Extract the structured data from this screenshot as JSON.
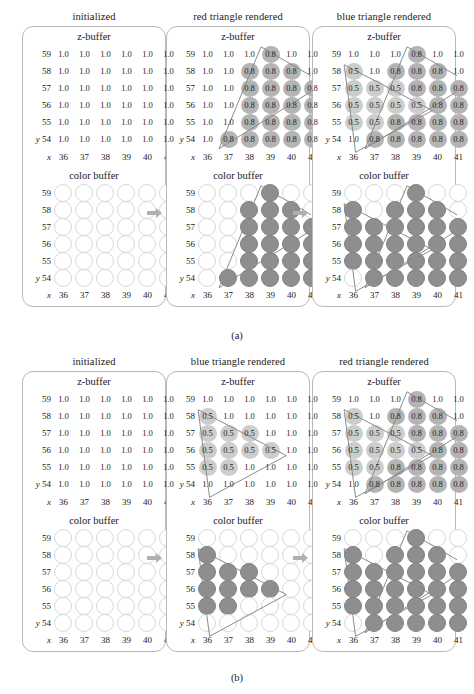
{
  "figure": {
    "captions": {
      "a": "(a)",
      "b": "(b)"
    },
    "axis_labels": {
      "x": "x",
      "y": "y"
    },
    "x_ticks": [
      "36",
      "37",
      "38",
      "39",
      "40",
      "41"
    ],
    "y_ticks": [
      "59",
      "58",
      "57",
      "56",
      "55",
      "54"
    ],
    "buffer_titles": {
      "z": "z-buffer",
      "color": "color buffer"
    },
    "colors": {
      "filled_circle": "#8e8e8e",
      "empty_circle_outline": "#d8d8d8",
      "disc_08": "#b4b4b4",
      "disc_05": "#cdcdcd",
      "panel_border": "#b9b9b9",
      "arrow": "#b0b0b0",
      "triangle_outline": "#8c8c8c"
    }
  },
  "rows": [
    {
      "id": "a",
      "caption": "(a)",
      "columns": [
        {
          "id": "a0",
          "heading": "initialized",
          "zbuffer": {
            "title": "z-buffer",
            "values": [
              [
                "1.0",
                "1.0",
                "1.0",
                "1.0",
                "1.0",
                "1.0"
              ],
              [
                "1.0",
                "1.0",
                "1.0",
                "1.0",
                "1.0",
                "1.0"
              ],
              [
                "1.0",
                "1.0",
                "1.0",
                "1.0",
                "1.0",
                "1.0"
              ],
              [
                "1.0",
                "1.0",
                "1.0",
                "1.0",
                "1.0",
                "1.0"
              ],
              [
                "1.0",
                "1.0",
                "1.0",
                "1.0",
                "1.0",
                "1.0"
              ],
              [
                "1.0",
                "1.0",
                "1.0",
                "1.0",
                "1.0",
                "1.0"
              ]
            ]
          },
          "colorbuffer": {
            "title": "color buffer",
            "filled": [
              [
                0,
                0,
                0,
                0,
                0,
                0
              ],
              [
                0,
                0,
                0,
                0,
                0,
                0
              ],
              [
                0,
                0,
                0,
                0,
                0,
                0
              ],
              [
                0,
                0,
                0,
                0,
                0,
                0
              ],
              [
                0,
                0,
                0,
                0,
                0,
                0
              ],
              [
                0,
                0,
                0,
                0,
                0,
                0
              ]
            ]
          },
          "triangles": []
        },
        {
          "id": "a1",
          "heading": "red triangle rendered",
          "zbuffer": {
            "title": "z-buffer",
            "values": [
              [
                "1.0",
                "1.0",
                "1.0",
                "0.8",
                "1.0",
                "1.0"
              ],
              [
                "1.0",
                "1.0",
                "0.8",
                "0.8",
                "0.8",
                "1.0"
              ],
              [
                "1.0",
                "1.0",
                "0.8",
                "0.8",
                "0.8",
                "0.8"
              ],
              [
                "1.0",
                "1.0",
                "0.8",
                "0.8",
                "0.8",
                "0.8"
              ],
              [
                "1.0",
                "1.0",
                "0.8",
                "0.8",
                "0.8",
                "0.8"
              ],
              [
                "1.0",
                "0.8",
                "0.8",
                "0.8",
                "0.8",
                "0.8"
              ]
            ]
          },
          "colorbuffer": {
            "title": "color buffer",
            "filled": [
              [
                0,
                0,
                0,
                1,
                0,
                0
              ],
              [
                0,
                0,
                1,
                1,
                1,
                0
              ],
              [
                0,
                0,
                1,
                1,
                1,
                1
              ],
              [
                0,
                0,
                1,
                1,
                1,
                1
              ],
              [
                0,
                0,
                1,
                1,
                1,
                1
              ],
              [
                0,
                1,
                1,
                1,
                1,
                1
              ]
            ]
          },
          "triangles": [
            "red"
          ]
        },
        {
          "id": "a2",
          "heading": "blue triangle rendered",
          "zbuffer": {
            "title": "z-buffer",
            "values": [
              [
                "1.0",
                "1.0",
                "1.0",
                "0.8",
                "1.0",
                "1.0"
              ],
              [
                "0.5",
                "1.0",
                "0.8",
                "0.8",
                "0.8",
                "1.0"
              ],
              [
                "0.5",
                "0.5",
                "0.5",
                "0.8",
                "0.8",
                "0.8"
              ],
              [
                "0.5",
                "0.5",
                "0.5",
                "0.5",
                "0.8",
                "0.8"
              ],
              [
                "0.5",
                "0.5",
                "0.8",
                "0.8",
                "0.8",
                "0.8"
              ],
              [
                "1.0",
                "0.8",
                "0.8",
                "0.8",
                "0.8",
                "0.8"
              ]
            ]
          },
          "colorbuffer": {
            "title": "color buffer",
            "filled": [
              [
                0,
                0,
                0,
                1,
                0,
                0
              ],
              [
                1,
                0,
                1,
                1,
                1,
                0
              ],
              [
                1,
                1,
                1,
                1,
                1,
                1
              ],
              [
                1,
                1,
                1,
                1,
                1,
                1
              ],
              [
                1,
                1,
                1,
                1,
                1,
                1
              ],
              [
                0,
                1,
                1,
                1,
                1,
                1
              ]
            ]
          },
          "triangles": [
            "red",
            "blue"
          ]
        }
      ]
    },
    {
      "id": "b",
      "caption": "(b)",
      "columns": [
        {
          "id": "b0",
          "heading": "initialized",
          "zbuffer": {
            "title": "z-buffer",
            "values": [
              [
                "1.0",
                "1.0",
                "1.0",
                "1.0",
                "1.0",
                "1.0"
              ],
              [
                "1.0",
                "1.0",
                "1.0",
                "1.0",
                "1.0",
                "1.0"
              ],
              [
                "1.0",
                "1.0",
                "1.0",
                "1.0",
                "1.0",
                "1.0"
              ],
              [
                "1.0",
                "1.0",
                "1.0",
                "1.0",
                "1.0",
                "1.0"
              ],
              [
                "1.0",
                "1.0",
                "1.0",
                "1.0",
                "1.0",
                "1.0"
              ],
              [
                "1.0",
                "1.0",
                "1.0",
                "1.0",
                "1.0",
                "1.0"
              ]
            ]
          },
          "colorbuffer": {
            "title": "color buffer",
            "filled": [
              [
                0,
                0,
                0,
                0,
                0,
                0
              ],
              [
                0,
                0,
                0,
                0,
                0,
                0
              ],
              [
                0,
                0,
                0,
                0,
                0,
                0
              ],
              [
                0,
                0,
                0,
                0,
                0,
                0
              ],
              [
                0,
                0,
                0,
                0,
                0,
                0
              ],
              [
                0,
                0,
                0,
                0,
                0,
                0
              ]
            ]
          },
          "triangles": []
        },
        {
          "id": "b1",
          "heading": "blue triangle rendered",
          "zbuffer": {
            "title": "z-buffer",
            "values": [
              [
                "1.0",
                "1.0",
                "1.0",
                "1.0",
                "1.0",
                "1.0"
              ],
              [
                "0.5",
                "1.0",
                "1.0",
                "1.0",
                "1.0",
                "1.0"
              ],
              [
                "0.5",
                "0.5",
                "0.5",
                "1.0",
                "1.0",
                "1.0"
              ],
              [
                "0.5",
                "0.5",
                "0.5",
                "0.5",
                "1.0",
                "1.0"
              ],
              [
                "0.5",
                "0.5",
                "1.0",
                "1.0",
                "1.0",
                "1.0"
              ],
              [
                "1.0",
                "1.0",
                "1.0",
                "1.0",
                "1.0",
                "1.0"
              ]
            ]
          },
          "colorbuffer": {
            "title": "color buffer",
            "filled": [
              [
                0,
                0,
                0,
                0,
                0,
                0
              ],
              [
                1,
                0,
                0,
                0,
                0,
                0
              ],
              [
                1,
                1,
                1,
                0,
                0,
                0
              ],
              [
                1,
                1,
                1,
                1,
                0,
                0
              ],
              [
                1,
                1,
                0,
                0,
                0,
                0
              ],
              [
                0,
                0,
                0,
                0,
                0,
                0
              ]
            ]
          },
          "triangles": [
            "blue"
          ]
        },
        {
          "id": "b2",
          "heading": "red triangle rendered",
          "zbuffer": {
            "title": "z-buffer",
            "values": [
              [
                "1.0",
                "1.0",
                "1.0",
                "0.8",
                "1.0",
                "1.0"
              ],
              [
                "0.5",
                "1.0",
                "0.8",
                "0.8",
                "0.8",
                "1.0"
              ],
              [
                "0.5",
                "0.5",
                "0.5",
                "0.8",
                "0.8",
                "0.8"
              ],
              [
                "0.5",
                "0.5",
                "0.5",
                "0.5",
                "0.8",
                "0.8"
              ],
              [
                "0.5",
                "0.5",
                "0.8",
                "0.8",
                "0.8",
                "0.8"
              ],
              [
                "1.0",
                "0.8",
                "0.8",
                "0.8",
                "0.8",
                "0.8"
              ]
            ]
          },
          "colorbuffer": {
            "title": "color buffer",
            "filled": [
              [
                0,
                0,
                0,
                1,
                0,
                0
              ],
              [
                1,
                0,
                1,
                1,
                1,
                0
              ],
              [
                1,
                1,
                1,
                1,
                1,
                1
              ],
              [
                1,
                1,
                1,
                1,
                1,
                1
              ],
              [
                1,
                1,
                1,
                1,
                1,
                1
              ],
              [
                0,
                1,
                1,
                1,
                1,
                1
              ]
            ]
          },
          "triangles": [
            "blue",
            "red"
          ]
        }
      ]
    }
  ]
}
